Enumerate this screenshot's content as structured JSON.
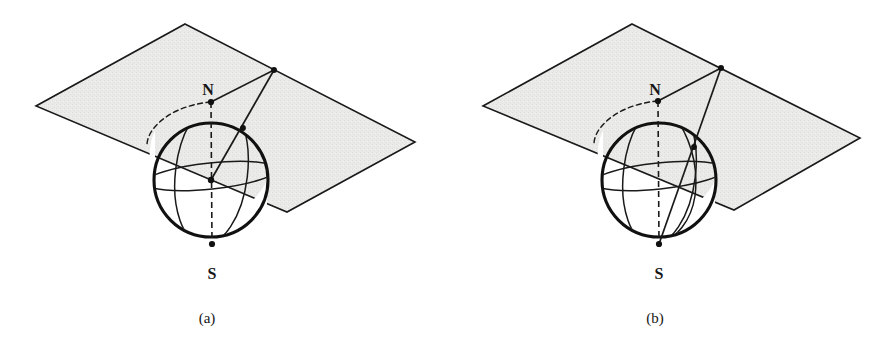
{
  "figure": {
    "background_color": "#ffffff",
    "ink_color": "#161616",
    "plane_fill_color": "#e9e9e7",
    "plane_stroke_color": "#1a1a1a",
    "panels": [
      {
        "id": "panel-a",
        "caption": "(a)",
        "caption_pos": [
          207,
          320
        ],
        "plane": {
          "corners": [
            [
              185,
              24
            ],
            [
              415,
              142
            ],
            [
              287,
              212
            ],
            [
              36,
              106
            ]
          ],
          "label": "projection-plane"
        },
        "sphere": {
          "center": [
            211,
            180
          ],
          "radius": 57,
          "north_pole": [
            211,
            102
          ],
          "south_pole": [
            212,
            244
          ],
          "north_label": "N",
          "north_label_pos": [
            208,
            90
          ],
          "south_label": "S",
          "south_label_pos": [
            212,
            273
          ]
        },
        "external_point": [
          274,
          70
        ],
        "sphere_point": [
          243,
          128
        ],
        "center_dot": [
          211,
          180
        ],
        "dots": [
          [
            274,
            70
          ],
          [
            243,
            128
          ],
          [
            211,
            102
          ],
          [
            212,
            244
          ],
          [
            211,
            180
          ]
        ],
        "rays": [
          {
            "from": [
              274,
              70
            ],
            "to": [
              211,
              102
            ],
            "name": "ray-point-to-north-pole"
          },
          {
            "from": [
              274,
              70
            ],
            "to": [
              211,
              180
            ],
            "name": "ray-point-through-sphere-to-center"
          }
        ],
        "has_center_dot": true,
        "extra_meridian": false
      },
      {
        "id": "panel-b",
        "caption": "(b)",
        "caption_pos": [
          655,
          320
        ],
        "plane": {
          "corners": [
            [
              632,
              24
            ],
            [
              860,
              138
            ],
            [
              734,
              210
            ],
            [
              483,
              106
            ]
          ],
          "label": "projection-plane"
        },
        "sphere": {
          "center": [
            659,
            180
          ],
          "radius": 57,
          "north_pole": [
            658,
            101
          ],
          "south_pole": [
            659,
            244
          ],
          "north_label": "N",
          "north_label_pos": [
            655,
            90
          ],
          "south_label": "S",
          "south_label_pos": [
            659,
            273
          ]
        },
        "external_point": [
          721,
          68
        ],
        "sphere_point": [
          694,
          147
        ],
        "dots": [
          [
            721,
            68
          ],
          [
            694,
            147
          ],
          [
            658,
            101
          ],
          [
            659,
            244
          ]
        ],
        "rays": [
          {
            "from": [
              721,
              68
            ],
            "to": [
              658,
              101
            ],
            "name": "ray-point-to-north-pole"
          },
          {
            "from": [
              721,
              68
            ],
            "to": [
              659,
              244
            ],
            "name": "ray-point-through-sphere-to-south-pole"
          }
        ],
        "has_center_dot": false,
        "extra_meridian": true
      }
    ]
  }
}
